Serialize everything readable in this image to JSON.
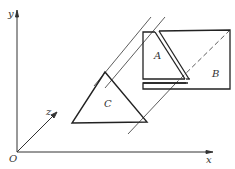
{
  "diagram": {
    "axes": {
      "origin_label": "O",
      "x_label": "x",
      "y_label": "y",
      "z_label": "z"
    },
    "shapes": [
      {
        "id": "A",
        "label": "A",
        "type": "quadrilateral"
      },
      {
        "id": "B",
        "label": "B",
        "type": "rectangle"
      },
      {
        "id": "C",
        "label": "C",
        "type": "triangle"
      }
    ],
    "colors": {
      "stroke": "#222222",
      "background": "#ffffff"
    }
  }
}
